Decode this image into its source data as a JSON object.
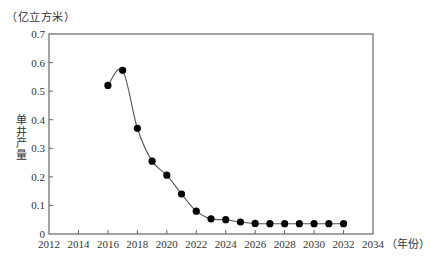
{
  "chart_data": {
    "type": "line",
    "title": "",
    "unit_label": "（亿立方米）",
    "ylabel": "单井产量",
    "xlabel": "（年份）",
    "xlim": [
      2012,
      2034
    ],
    "ylim": [
      0,
      0.7
    ],
    "x_ticks": [
      2012,
      2014,
      2016,
      2018,
      2020,
      2022,
      2024,
      2026,
      2028,
      2030,
      2032,
      2034
    ],
    "y_ticks": [
      0,
      0.1,
      0.2,
      0.3,
      0.4,
      0.5,
      0.6,
      0.7
    ],
    "grid": false,
    "legend": null,
    "series": [
      {
        "name": "单井产量",
        "marker": "filled-circle",
        "line": "smooth",
        "color": "#000000",
        "x": [
          2016,
          2017,
          2018,
          2019,
          2020,
          2021,
          2022,
          2023,
          2024,
          2025,
          2026,
          2027,
          2028,
          2029,
          2030,
          2031,
          2032
        ],
        "values": [
          0.52,
          0.573,
          0.37,
          0.255,
          0.206,
          0.14,
          0.08,
          0.053,
          0.05,
          0.042,
          0.037,
          0.036,
          0.036,
          0.036,
          0.036,
          0.036,
          0.036
        ]
      }
    ]
  },
  "labels": {
    "unit": "（亿立方米）",
    "ylabel_chars": [
      "单",
      "井",
      "产",
      "量"
    ],
    "x_suffix": "（年份）"
  }
}
